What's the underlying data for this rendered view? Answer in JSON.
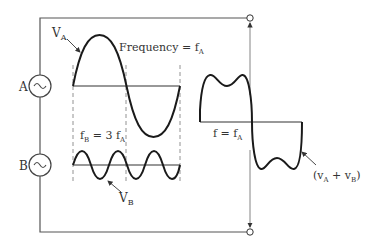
{
  "diagram": {
    "sources": [
      {
        "id": "A",
        "label": "A",
        "symbol": "~"
      },
      {
        "id": "B",
        "label": "B",
        "symbol": "~"
      }
    ],
    "labels": {
      "va": "V",
      "va_sub": "A",
      "frequency": "Frequency = f",
      "frequency_sub": "A",
      "fb_f": "f",
      "fb_sub": "B",
      "fb_eq": " = 3 f",
      "fb_eq_sub": "A",
      "vb": "V",
      "vb_sub": "B",
      "f_eq": "f = f",
      "f_eq_sub": "A",
      "sum_open": "(v",
      "sum_a_sub": "A",
      "sum_plus": " + v",
      "sum_b_sub": "B",
      "sum_close": ")"
    },
    "colors": {
      "wave": "#1a1a1a",
      "wire": "#555555",
      "dashed": "#777777",
      "text": "#333333"
    }
  }
}
